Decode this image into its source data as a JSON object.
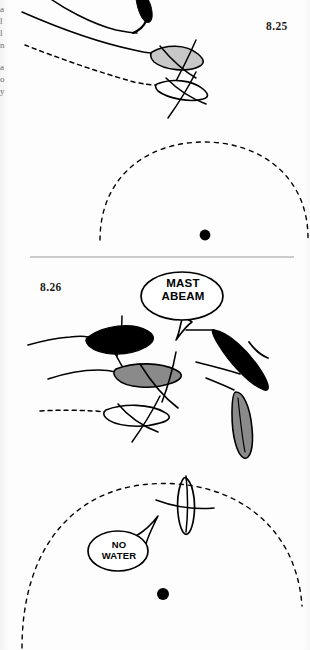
{
  "page": {
    "background_color": "#fdfdfd",
    "ink_color": "#000000",
    "divider_color": "#9a9a9a"
  },
  "margin_fragments": [
    {
      "text": "a"
    },
    {
      "text": "l"
    },
    {
      "text": "l"
    },
    {
      "text": "n"
    },
    {
      "text": "a"
    },
    {
      "text": "o"
    },
    {
      "text": "y"
    }
  ],
  "figures": [
    {
      "id": "figure-8-25",
      "number": "8.25",
      "mark": {
        "label": "mark-buoy",
        "color": "#000000"
      },
      "zone": {
        "label": "zone-arc",
        "style": "dashed"
      },
      "boats": [
        {
          "name": "boat-black-top",
          "fill": "#000000",
          "hull": "black"
        },
        {
          "name": "boat-gray-upper",
          "fill": "#c8c8c8",
          "hull": "gray"
        },
        {
          "name": "boat-white-lower",
          "fill": "#ffffff",
          "hull": "white"
        }
      ],
      "tracks": [
        {
          "name": "track-solid-outer",
          "style": "solid"
        },
        {
          "name": "track-solid-inner",
          "style": "solid"
        },
        {
          "name": "track-dashed",
          "style": "dashed"
        }
      ],
      "callouts": []
    },
    {
      "id": "figure-8-26",
      "number": "8.26",
      "mark": {
        "label": "mark-buoy",
        "color": "#000000"
      },
      "zone": {
        "label": "zone-arc",
        "style": "dashed"
      },
      "boats": [
        {
          "name": "boat-black-left",
          "fill": "#000000",
          "hull": "black"
        },
        {
          "name": "boat-gray-middle",
          "fill": "#8a8a8a",
          "hull": "gray"
        },
        {
          "name": "boat-white-left",
          "fill": "#ffffff",
          "hull": "white"
        },
        {
          "name": "boat-black-right",
          "fill": "#000000",
          "hull": "black"
        },
        {
          "name": "boat-gray-right",
          "fill": "#8a8a8a",
          "hull": "gray"
        },
        {
          "name": "boat-white-bottom",
          "fill": "#ffffff",
          "hull": "white"
        }
      ],
      "tracks": [
        {
          "name": "track-solid-upper",
          "style": "solid"
        },
        {
          "name": "track-solid-middle",
          "style": "solid"
        },
        {
          "name": "track-dashed-lower",
          "style": "dashed"
        }
      ],
      "callouts": [
        {
          "name": "callout-mast-abeam",
          "line1": "MAST",
          "line2": "ABEAM",
          "tail": "down"
        },
        {
          "name": "callout-no-water",
          "line1": "NO",
          "line2": "WATER",
          "tail": "up-right"
        }
      ]
    }
  ]
}
